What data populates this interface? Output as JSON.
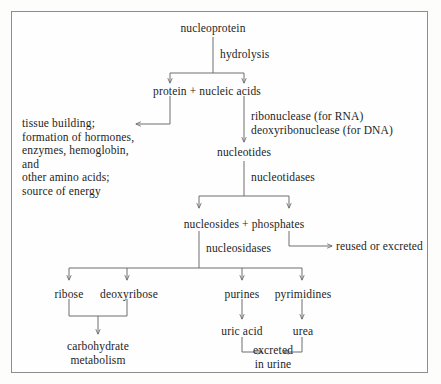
{
  "diagram": {
    "type": "flowchart",
    "border_color": "#8d8d8d",
    "line_color": "#6e6e6e",
    "text_color": "#1d1d1d",
    "nodes": {
      "nucleoprotein": "nucleoprotein",
      "hydrolysis": "hydrolysis",
      "protein_nucleic_acids": "protein + nucleic acids",
      "tissue_building_line1": "tissue building;",
      "tissue_building_line2": "formation of hormones,",
      "tissue_building_line3": "enzymes, hemoglobin, and",
      "tissue_building_line4": "other amino acids;",
      "tissue_building_line5": "source of energy",
      "ribonuclease": "ribonuclease (for RNA)",
      "deoxyribonuclease": "deoxyribonuclease (for DNA)",
      "nucleotides": "nucleotides",
      "nucleotidases": "nucleotidases",
      "nucleosides_phosphates": "nucleosides + phosphates",
      "nucleosidases": "nucleosidases",
      "reused_or_excreted": "reused or excreted",
      "ribose": "ribose",
      "deoxyribose": "deoxyribose",
      "purines": "purines",
      "pyrimidines": "pyrimidines",
      "carbohydrate_line1": "carbohydrate",
      "carbohydrate_line2": "metabolism",
      "uric_acid": "uric acid",
      "urea": "urea",
      "excreted_line1": "excreted",
      "excreted_line2": "in urine"
    },
    "edges": [
      {
        "from": "nucleoprotein",
        "to": "protein + nucleic acids",
        "label": "hydrolysis"
      },
      {
        "from": "protein + nucleic acids",
        "to": "tissue building; formation of hormones, enzymes, hemoglobin, and other amino acids; source of energy",
        "label": ""
      },
      {
        "from": "protein + nucleic acids",
        "to": "nucleotides",
        "label": "ribonuclease (for RNA) / deoxyribonuclease (for DNA)"
      },
      {
        "from": "nucleotides",
        "to": "nucleosides + phosphates",
        "label": "nucleotidases"
      },
      {
        "from": "nucleosides + phosphates",
        "to": "reused or excreted",
        "label": ""
      },
      {
        "from": "nucleosides + phosphates",
        "to": "ribose",
        "label": "nucleosidases"
      },
      {
        "from": "nucleosides + phosphates",
        "to": "deoxyribose",
        "label": "nucleosidases"
      },
      {
        "from": "nucleosides + phosphates",
        "to": "purines",
        "label": "nucleosidases"
      },
      {
        "from": "nucleosides + phosphates",
        "to": "pyrimidines",
        "label": "nucleosidases"
      },
      {
        "from": "ribose",
        "to": "carbohydrate metabolism",
        "label": ""
      },
      {
        "from": "deoxyribose",
        "to": "carbohydrate metabolism",
        "label": ""
      },
      {
        "from": "purines",
        "to": "uric acid",
        "label": ""
      },
      {
        "from": "pyrimidines",
        "to": "urea",
        "label": ""
      },
      {
        "from": "uric acid",
        "to": "excreted in urine",
        "label": ""
      },
      {
        "from": "urea",
        "to": "excreted in urine",
        "label": ""
      }
    ]
  }
}
